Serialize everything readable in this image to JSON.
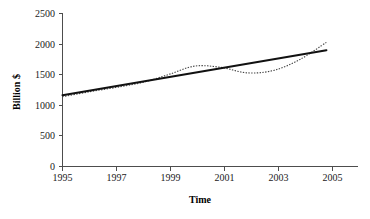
{
  "chart_data": {
    "type": "line",
    "title": "",
    "xlabel": "Time",
    "ylabel": "Billion $",
    "xlim": [
      1995,
      2005.4
    ],
    "ylim": [
      0,
      2500
    ],
    "grid": false,
    "legend": "none",
    "x_ticks": [
      "1995",
      "1997",
      "1999",
      "2001",
      "2003",
      "2005"
    ],
    "x_tick_values": [
      1995,
      1997,
      1999,
      2001,
      2003,
      2005
    ],
    "y_ticks": [
      "0",
      "500",
      "1000",
      "1500",
      "2000",
      "2500"
    ],
    "y_tick_values": [
      0,
      500,
      1000,
      1500,
      2000,
      2500
    ],
    "x": [
      1995,
      1996,
      1997,
      1998,
      1999,
      2000,
      2001,
      2002,
      2003,
      2004,
      2005
    ],
    "series": [
      {
        "name": "Observed series",
        "style": "dotted",
        "color": "#444444",
        "values": [
          1140,
          1220,
          1290,
          1370,
          1500,
          1640,
          1620,
          1530,
          1570,
          1750,
          2030
        ]
      },
      {
        "name": "Linear trend",
        "style": "solid",
        "color": "#111111",
        "values": [
          1165,
          1240,
          1313,
          1387,
          1460,
          1534,
          1607,
          1681,
          1754,
          1828,
          1900
        ]
      }
    ]
  },
  "axis": {
    "x_title": "Time",
    "y_title": "Billion $"
  }
}
